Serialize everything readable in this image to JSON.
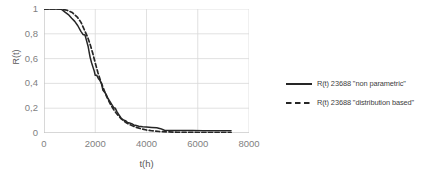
{
  "chart_data": {
    "type": "line",
    "title": "",
    "xlabel": "t(h)",
    "ylabel": "R(t)",
    "xlim": [
      0,
      8000
    ],
    "ylim": [
      0,
      1
    ],
    "grid": true,
    "legend_position": "right",
    "xticks": [
      "0",
      "2000",
      "4000",
      "6000",
      "8000"
    ],
    "xtick_values": [
      0,
      2000,
      4000,
      6000,
      8000
    ],
    "yticks": [
      "0",
      "0,2",
      "0,4",
      "0,6",
      "0,8",
      "1"
    ],
    "ytick_values": [
      0,
      0.2,
      0.4,
      0.6,
      0.8,
      1
    ],
    "series": [
      {
        "name": "R(t) 23688 \"non parametric\"",
        "style": "solid",
        "color": "#262626",
        "x": [
          0,
          500,
          640,
          700,
          820,
          950,
          1080,
          1200,
          1320,
          1440,
          1520,
          1600,
          1660,
          1720,
          1760,
          1800,
          1860,
          1920,
          1960,
          2000,
          2060,
          2120,
          2180,
          2240,
          2300,
          2360,
          2420,
          2480,
          2540,
          2600,
          2660,
          2720,
          2780,
          2840,
          2900,
          2960,
          3020,
          3100,
          3180,
          3260,
          3340,
          3420,
          3500,
          3600,
          3700,
          3850,
          4000,
          4200,
          4400,
          4550,
          4700,
          5000,
          5400,
          5800,
          6200,
          6600,
          7000,
          7300
        ],
        "y": [
          1.0,
          1.0,
          1.0,
          0.995,
          0.975,
          0.955,
          0.925,
          0.9,
          0.865,
          0.82,
          0.795,
          0.79,
          0.745,
          0.7,
          0.655,
          0.61,
          0.565,
          0.525,
          0.5,
          0.465,
          0.465,
          0.44,
          0.425,
          0.4,
          0.345,
          0.33,
          0.315,
          0.285,
          0.265,
          0.245,
          0.225,
          0.205,
          0.2,
          0.175,
          0.155,
          0.135,
          0.115,
          0.105,
          0.1,
          0.085,
          0.08,
          0.075,
          0.065,
          0.06,
          0.055,
          0.05,
          0.048,
          0.045,
          0.042,
          0.035,
          0.022,
          0.02,
          0.02,
          0.02,
          0.018,
          0.018,
          0.018,
          0.018
        ]
      },
      {
        "name": "R(t) 23688 \"distribution based\"",
        "style": "dashed",
        "color": "#262626",
        "x": [
          0,
          500,
          700,
          900,
          1100,
          1300,
          1450,
          1600,
          1700,
          1800,
          1900,
          2000,
          2100,
          2200,
          2300,
          2400,
          2500,
          2600,
          2700,
          2800,
          2900,
          3000,
          3100,
          3200,
          3300,
          3450,
          3600,
          3800,
          4000,
          4200,
          4500,
          4800,
          5200,
          5600,
          6000,
          6400,
          6800,
          7200,
          7300
        ],
        "y": [
          1.0,
          1.0,
          0.998,
          0.99,
          0.972,
          0.935,
          0.89,
          0.82,
          0.775,
          0.715,
          0.645,
          0.565,
          0.49,
          0.425,
          0.37,
          0.315,
          0.27,
          0.23,
          0.195,
          0.165,
          0.14,
          0.118,
          0.1,
          0.085,
          0.072,
          0.058,
          0.046,
          0.033,
          0.024,
          0.018,
          0.012,
          0.009,
          0.006,
          0.005,
          0.004,
          0.004,
          0.004,
          0.004,
          0.004
        ]
      }
    ]
  },
  "legend": {
    "items": [
      {
        "label": "R(t) 23688 \"non parametric\"",
        "style": "solid"
      },
      {
        "label": "R(t) 23688 \"distribution based\"",
        "style": "dashed"
      }
    ]
  }
}
